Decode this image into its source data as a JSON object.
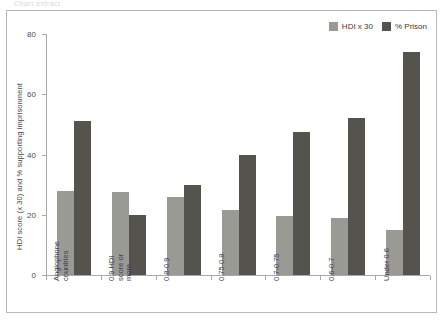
{
  "top_caption": "Chart extract",
  "chart_data": {
    "type": "bar",
    "title": "",
    "xlabel": "",
    "ylabel": "HDI score (x 30) and % supporting imprisonment",
    "ylim": [
      0,
      80
    ],
    "yticks": [
      0,
      20,
      40,
      60,
      80
    ],
    "grid": false,
    "legend_position": "top-right",
    "categories": [
      "Anglophone\ncountries",
      "0.9 HDI\nscore or\nmore",
      "0.8-0.9",
      "0.75-0.8",
      "0.7-0.75",
      "0.6-0.7",
      "Under 0.6"
    ],
    "series": [
      {
        "name": "HDI x 30",
        "color": "#9a9a94",
        "values": [
          28,
          27.5,
          26,
          21.5,
          19.5,
          19,
          15
        ]
      },
      {
        "name": "% Prison",
        "color": "#55534e",
        "values": [
          51,
          20,
          30,
          40,
          47.5,
          52,
          74
        ]
      }
    ]
  },
  "colors": {
    "hdi": "#9a9a94",
    "prison": "#55534e",
    "axis": "#a9a9a9",
    "frame": "#b9b9b9",
    "text": "#3a3a3a",
    "category_text": "#3c3c58"
  }
}
